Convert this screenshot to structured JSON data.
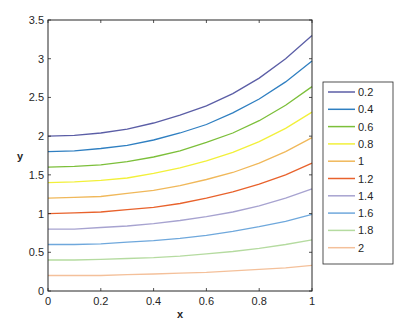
{
  "chart_data": {
    "type": "line",
    "title": "",
    "xlabel": "x",
    "ylabel": "y",
    "xlim": [
      0,
      1
    ],
    "ylim": [
      0,
      3.5
    ],
    "xticks": [
      "0",
      "0.2",
      "0.4",
      "0.6",
      "0.8",
      "1"
    ],
    "yticks": [
      "0",
      "0.5",
      "1",
      "1.5",
      "2",
      "2.5",
      "3",
      "3.5"
    ],
    "grid": false,
    "legend_position": "right outside",
    "x": [
      0,
      0.1,
      0.2,
      0.3,
      0.4,
      0.5,
      0.6,
      0.7,
      0.8,
      0.9,
      1.0
    ],
    "series": [
      {
        "name": "0.2",
        "color": "#5b5ea6",
        "values": [
          2.0,
          2.01,
          2.04,
          2.09,
          2.17,
          2.27,
          2.39,
          2.55,
          2.75,
          3.0,
          3.3
        ]
      },
      {
        "name": "0.4",
        "color": "#2f7fc1",
        "values": [
          1.8,
          1.81,
          1.84,
          1.88,
          1.95,
          2.04,
          2.15,
          2.3,
          2.48,
          2.7,
          2.97
        ]
      },
      {
        "name": "0.6",
        "color": "#7cbf3a",
        "values": [
          1.6,
          1.61,
          1.63,
          1.67,
          1.73,
          1.81,
          1.92,
          2.04,
          2.2,
          2.4,
          2.64
        ]
      },
      {
        "name": "0.8",
        "color": "#f2f03a",
        "values": [
          1.4,
          1.41,
          1.43,
          1.46,
          1.52,
          1.59,
          1.68,
          1.79,
          1.93,
          2.1,
          2.31
        ]
      },
      {
        "name": "1",
        "color": "#f0b85a",
        "values": [
          1.2,
          1.21,
          1.22,
          1.26,
          1.3,
          1.36,
          1.44,
          1.53,
          1.65,
          1.8,
          1.98
        ]
      },
      {
        "name": "1.2",
        "color": "#e8622c",
        "values": [
          1.0,
          1.01,
          1.02,
          1.05,
          1.08,
          1.13,
          1.2,
          1.28,
          1.38,
          1.5,
          1.65
        ]
      },
      {
        "name": "1.4",
        "color": "#a7a3d0",
        "values": [
          0.8,
          0.8,
          0.82,
          0.84,
          0.87,
          0.91,
          0.96,
          1.02,
          1.1,
          1.2,
          1.32
        ]
      },
      {
        "name": "1.6",
        "color": "#6fa8dc",
        "values": [
          0.6,
          0.6,
          0.61,
          0.63,
          0.65,
          0.68,
          0.72,
          0.77,
          0.83,
          0.9,
          0.99
        ]
      },
      {
        "name": "1.8",
        "color": "#b5dba0",
        "values": [
          0.4,
          0.4,
          0.41,
          0.42,
          0.43,
          0.45,
          0.48,
          0.51,
          0.55,
          0.6,
          0.66
        ]
      },
      {
        "name": "2",
        "color": "#f4c09a",
        "values": [
          0.2,
          0.2,
          0.2,
          0.21,
          0.22,
          0.23,
          0.24,
          0.26,
          0.28,
          0.3,
          0.33
        ]
      }
    ]
  }
}
